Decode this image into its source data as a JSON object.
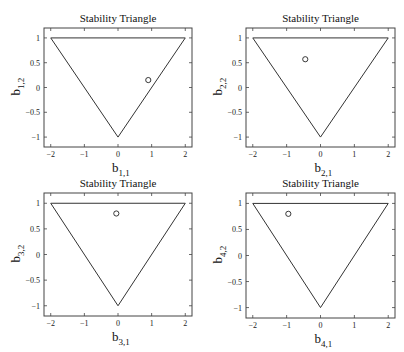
{
  "figure": {
    "layout": "2x2 subplots"
  },
  "chart_data": [
    {
      "type": "scatter",
      "title": "Stability Triangle",
      "xlabel": "b",
      "xlabel_sub": "1,1",
      "ylabel": "b",
      "ylabel_sub": "1,2",
      "xlim": [
        -2.2,
        2.2
      ],
      "ylim": [
        -1.2,
        1.2
      ],
      "xticks": [
        -2,
        -1,
        0,
        1,
        2
      ],
      "xtick_labels": [
        "−2",
        "−1",
        "0",
        "1",
        "2"
      ],
      "yticks": [
        1,
        0.5,
        0,
        -0.5,
        -1
      ],
      "ytick_labels": [
        "1",
        "0.5",
        "0",
        "−0.5",
        "−1"
      ],
      "grid": false,
      "triangle": [
        [
          -2,
          1
        ],
        [
          2,
          1
        ],
        [
          0,
          -1
        ]
      ],
      "points": [
        {
          "x": 0.9,
          "y": 0.15,
          "marker": "o"
        }
      ]
    },
    {
      "type": "scatter",
      "title": "Stability Triangle",
      "xlabel": "b",
      "xlabel_sub": "2,1",
      "ylabel": "b",
      "ylabel_sub": "2,2",
      "xlim": [
        -2.2,
        2.2
      ],
      "ylim": [
        -1.2,
        1.2
      ],
      "xticks": [
        -2,
        -1,
        0,
        1,
        2
      ],
      "xtick_labels": [
        "−2",
        "−1",
        "0",
        "1",
        "2"
      ],
      "yticks": [
        1,
        0.5,
        0,
        -0.5,
        -1
      ],
      "ytick_labels": [
        "1",
        "0.5",
        "0",
        "−0.5",
        "−1"
      ],
      "grid": false,
      "triangle": [
        [
          -2,
          1
        ],
        [
          2,
          1
        ],
        [
          0,
          -1
        ]
      ],
      "points": [
        {
          "x": -0.45,
          "y": 0.57,
          "marker": "o"
        }
      ]
    },
    {
      "type": "scatter",
      "title": "Stability Triangle",
      "xlabel": "b",
      "xlabel_sub": "3,1",
      "ylabel": "b",
      "ylabel_sub": "3,2",
      "xlim": [
        -2.2,
        2.2
      ],
      "ylim": [
        -1.2,
        1.2
      ],
      "xticks": [
        -2,
        -1,
        0,
        1,
        2
      ],
      "xtick_labels": [
        "−2",
        "−1",
        "0",
        "1",
        "2"
      ],
      "yticks": [
        1,
        0.5,
        0,
        -0.5,
        -1
      ],
      "ytick_labels": [
        "1",
        "0.5",
        "0",
        "−0.5",
        "−1"
      ],
      "grid": false,
      "triangle": [
        [
          -2,
          1
        ],
        [
          2,
          1
        ],
        [
          0,
          -1
        ]
      ],
      "points": [
        {
          "x": -0.05,
          "y": 0.8,
          "marker": "o"
        }
      ]
    },
    {
      "type": "scatter",
      "title": "Stability Triangle",
      "xlabel": "b",
      "xlabel_sub": "4,1",
      "ylabel": "b",
      "ylabel_sub": "4,2",
      "xlim": [
        -2.2,
        2.2
      ],
      "ylim": [
        -1.2,
        1.2
      ],
      "xticks": [
        -2,
        -1,
        0,
        1,
        2
      ],
      "xtick_labels": [
        "−2",
        "−1",
        "0",
        "1",
        "2"
      ],
      "yticks": [
        1,
        0.5,
        0,
        -0.5,
        -1
      ],
      "ytick_labels": [
        "1",
        "0.5",
        "0",
        "−0.5",
        "−1"
      ],
      "grid": false,
      "triangle": [
        [
          -2,
          1
        ],
        [
          2,
          1
        ],
        [
          0,
          -1
        ]
      ],
      "points": [
        {
          "x": -0.95,
          "y": 0.8,
          "marker": "o"
        }
      ]
    }
  ]
}
